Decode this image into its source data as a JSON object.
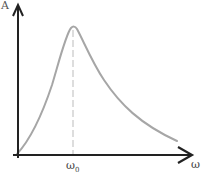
{
  "diagram": {
    "y_axis_label": "A",
    "x_axis_label": "ω",
    "marker_label": "ω",
    "marker_subscript": "0",
    "colors": {
      "axis": "#222222",
      "curve": "#a6a6a6",
      "marker_line": "#bbbbbb"
    }
  }
}
